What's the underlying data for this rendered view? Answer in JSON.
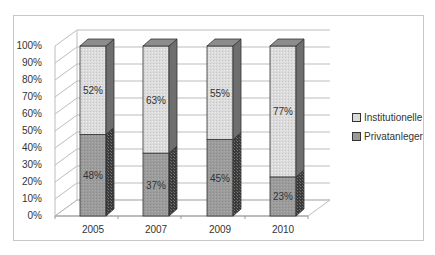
{
  "chart_data": {
    "type": "bar",
    "stacked": true,
    "percent": true,
    "style": "3d-column",
    "title": "",
    "xlabel": "",
    "ylabel": "",
    "categories": [
      "2005",
      "2007",
      "2009",
      "2010"
    ],
    "series": [
      {
        "name": "Privatanleger",
        "values": [
          48,
          37,
          45,
          23
        ],
        "color": "#9a9a9a"
      },
      {
        "name": "Institutionelle",
        "values": [
          52,
          63,
          55,
          77
        ],
        "color": "#d9d9d9"
      }
    ],
    "data_labels": {
      "Privatanleger": [
        "48%",
        "37%",
        "45%",
        "23%"
      ],
      "Institutionelle": [
        "52%",
        "63%",
        "55%",
        "77%"
      ]
    },
    "yticks": [
      "0%",
      "10%",
      "20%",
      "30%",
      "40%",
      "50%",
      "60%",
      "70%",
      "80%",
      "90%",
      "100%"
    ],
    "ylim": [
      0,
      100
    ],
    "grid": true,
    "legend_position": "right",
    "legend": [
      "Institutionelle",
      "Privatanleger"
    ]
  }
}
